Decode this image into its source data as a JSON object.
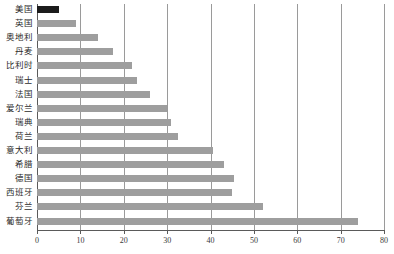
{
  "chart_data": {
    "type": "bar",
    "orientation": "horizontal",
    "title": "",
    "subtitle": "",
    "xlabel": "",
    "ylabel": "",
    "xlim": [
      0,
      80
    ],
    "xticks": [
      0,
      10,
      20,
      30,
      40,
      50,
      60,
      70,
      80
    ],
    "tick_labels": [
      "0",
      "10",
      "20",
      "30",
      "40",
      "50",
      "60",
      "70",
      "80"
    ],
    "grid": "vertical",
    "legend": "none",
    "categories": [
      "美国",
      "英国",
      "奥地利",
      "丹麦",
      "比利时",
      "瑞士",
      "法国",
      "爱尔兰",
      "瑞典",
      "荷兰",
      "意大利",
      "希腊",
      "德国",
      "西班牙",
      "芬兰",
      "葡萄牙"
    ],
    "values": [
      5,
      9,
      14,
      17.5,
      22,
      23,
      26,
      30,
      31,
      32.5,
      40.5,
      43,
      45.5,
      45,
      52,
      74
    ],
    "series": [
      {
        "name": "",
        "values": [
          5,
          9,
          14,
          17.5,
          22,
          23,
          26,
          30,
          31,
          32.5,
          40.5,
          43,
          45.5,
          45,
          52,
          74
        ]
      }
    ],
    "highlight_index": 0,
    "colors": {
      "bar": "#9e9e9e",
      "bar_highlight": "#1c1c1c",
      "gridline": "#9a9a9a",
      "axis": "#5a5a5a",
      "text": "#2b2b2b",
      "background": "#ffffff"
    }
  }
}
